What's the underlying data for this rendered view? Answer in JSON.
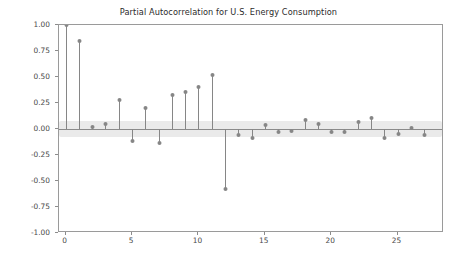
{
  "chart_data": {
    "type": "bar",
    "subtype": "stem-plot-pacf",
    "title": "Partial Autocorrelation for U.S. Energy Consumption",
    "xlabel": "",
    "ylabel": "",
    "categories": [
      0,
      1,
      2,
      3,
      4,
      5,
      6,
      7,
      8,
      9,
      10,
      11,
      12,
      13,
      14,
      15,
      16,
      17,
      18,
      19,
      20,
      21,
      22,
      23,
      24,
      25,
      26,
      27
    ],
    "values": [
      1.0,
      0.85,
      0.02,
      0.05,
      0.28,
      -0.12,
      0.2,
      -0.13,
      0.33,
      0.36,
      0.4,
      0.52,
      -0.58,
      -0.06,
      -0.09,
      0.04,
      -0.03,
      -0.02,
      0.09,
      0.05,
      -0.03,
      -0.03,
      0.07,
      0.11,
      -0.09,
      -0.05,
      0.01,
      -0.06
    ],
    "xlim": [
      -0.5,
      28.5
    ],
    "ylim": [
      -1.0,
      1.0
    ],
    "ytick_labels": [
      "1.00",
      "0.75",
      "0.50",
      "0.25",
      "0.00",
      "-0.25",
      "-0.50",
      "-0.75",
      "-1.00"
    ],
    "ytick_values": [
      1.0,
      0.75,
      0.5,
      0.25,
      0.0,
      -0.25,
      -0.5,
      -0.75,
      -1.0
    ],
    "xtick_labels": [
      "0",
      "5",
      "10",
      "15",
      "20",
      "25"
    ],
    "xtick_values": [
      0,
      5,
      10,
      15,
      20,
      25
    ],
    "grid": false,
    "legend": null,
    "confidence_band": {
      "upper": 0.075,
      "lower": -0.075,
      "color": "#d9d9d9"
    },
    "series_color": "#868686",
    "axis_color": "#9a9a9a",
    "text_color": "#4a4a4a"
  }
}
